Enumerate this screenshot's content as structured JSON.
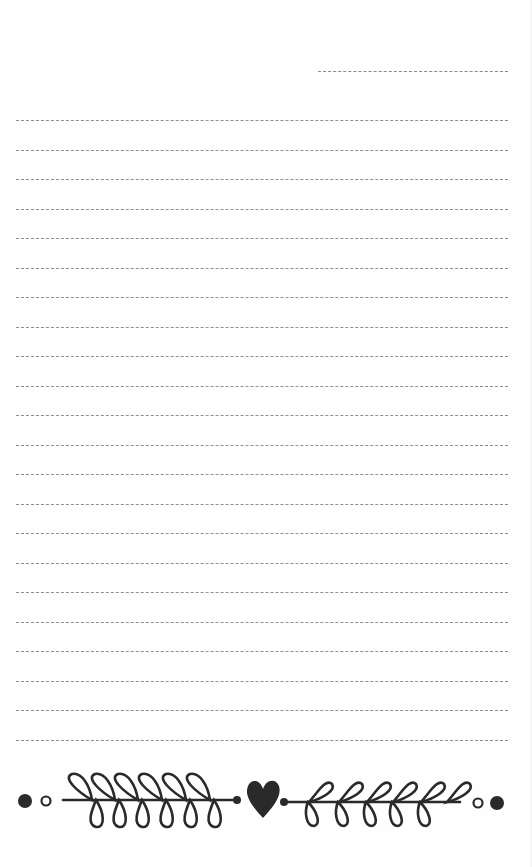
{
  "page": {
    "type": "notepad-sheet",
    "background_color": "#fefefe",
    "line_color": "#8f8f8f",
    "ink_color": "#2a2a2a"
  },
  "header": {
    "date_line": {
      "x": 318,
      "y": 71,
      "width": 190
    }
  },
  "ruled_lines": {
    "count": 22,
    "start_y": 120,
    "spacing": 29.5,
    "x": 16,
    "width": 492
  },
  "footer_ornament": {
    "icons": [
      "filled-dot-icon",
      "hollow-dot-icon",
      "left-laurel-branch-icon",
      "heart-icon",
      "right-laurel-branch-icon",
      "hollow-dot-icon",
      "filled-dot-icon"
    ]
  }
}
